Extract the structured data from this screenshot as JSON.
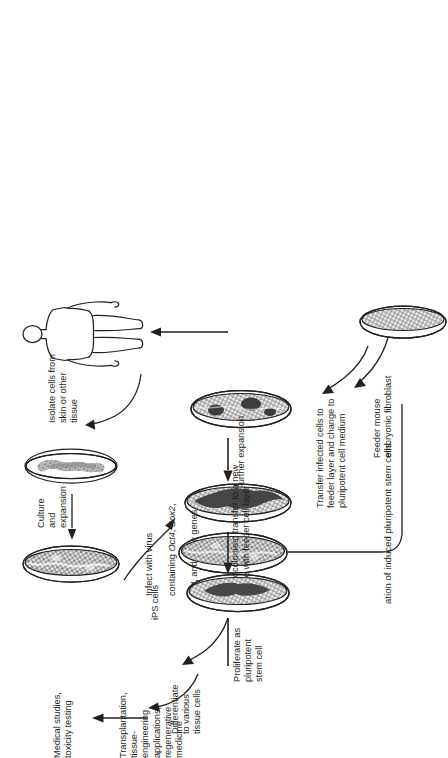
{
  "figure": {
    "caption": "ation of induced pluripotent stem cells.",
    "ink_color": "#231f20",
    "background_color": "#ffffff"
  },
  "labels": {
    "isolate": "Isolate cells from\nskin or other\ntissue",
    "culture_expansion": "Culture\nand\nexpansion",
    "infect_line1": "Infect with virus",
    "infect_line2_pre": "containing ",
    "infect_gene1": "Oct4",
    "infect_sep1": ", ",
    "infect_gene2": "Sox2",
    "infect_sep2": ",",
    "infect_gene3": "klf4",
    "infect_sep3": ", and ",
    "infect_gene4": "cMyc",
    "infect_tail": " genes",
    "transfer_infected": "Transfer infected cells to\nfeeder layer and change to\npluripotent cell medium",
    "feeder": "Feeder mouse\nembryonic fibroblast",
    "further_expansion": "Further expansion",
    "pick_colonies": "Pick colonies; transfer to a new\nplate with feeder cell layer",
    "ips_cells": "iPS cells",
    "proliferate": "Proliferate as\npluripotent\nstem cell",
    "differentiate": "Differentiate\nto various\ntissue cells",
    "medical_studies": "Medical studies,\ntoxicity testing",
    "transplantation": "Transplantation,\ntissue-\nengineering\napplications,\nregenerative\nmedicine"
  },
  "dishes": [
    {
      "name": "skin-tissue-cells-dish",
      "fill": "sparse"
    },
    {
      "name": "cultured-fibroblast-dish",
      "fill": "dense"
    },
    {
      "name": "infected-cells-dish",
      "fill": "dense"
    },
    {
      "name": "feeder-layer-colony-dish",
      "fill": "dense"
    },
    {
      "name": "expanded-colony-dish",
      "fill": "dense"
    },
    {
      "name": "ips-cells-dish",
      "fill": "dense"
    },
    {
      "name": "feeder-mef-dish",
      "fill": "mesh"
    }
  ]
}
